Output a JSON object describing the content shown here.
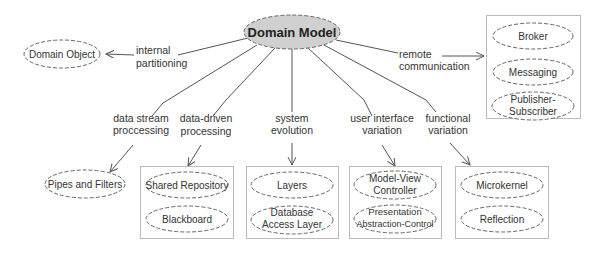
{
  "diagram": {
    "root": {
      "label": "Domain Model",
      "fill": "#d0d0d0"
    },
    "edges": [
      {
        "id": "internal",
        "line1": "internal",
        "line2": "partitioning"
      },
      {
        "id": "remote",
        "line1": "remote",
        "line2": "communication"
      },
      {
        "id": "datastream",
        "line1": "data stream",
        "line2": "proccessing"
      },
      {
        "id": "datadriven",
        "line1": "data-driven",
        "line2": "processing"
      },
      {
        "id": "system",
        "line1": "system",
        "line2": "evolution"
      },
      {
        "id": "ui",
        "line1": "user interface",
        "line2": "variation"
      },
      {
        "id": "functional",
        "line1": "functional",
        "line2": "variation"
      }
    ],
    "nodes": {
      "domain_object": "Domain Object",
      "pipes_filters": "Pipes and Filters",
      "broker": "Broker",
      "messaging": "Messaging",
      "pubsub_1": "Publisher-",
      "pubsub_2": "Subscriber",
      "shared_repository": "Shared Repository",
      "blackboard": "Blackboard",
      "layers": "Layers",
      "dal_1": "Database",
      "dal_2": "Access Layer",
      "mvc_1": "Model-View",
      "mvc_2": "Controller",
      "pac_1": "Presentation",
      "pac_2": "Abstraction-Control",
      "microkernel": "Microkernel",
      "reflection": "Reflection"
    },
    "colors": {
      "line": "#555555",
      "box": "#bbbbbb",
      "dash": "#666666"
    }
  }
}
